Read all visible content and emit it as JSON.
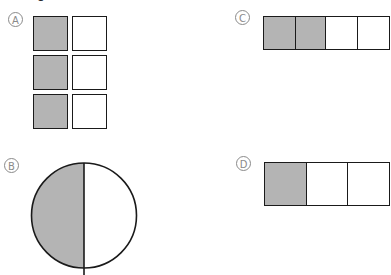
{
  "fragment_text": "1",
  "options": [
    {
      "id": "A",
      "label": "A",
      "shape": "grid",
      "rows": 3,
      "cols": 2,
      "total_parts": 6,
      "shaded_parts": 3,
      "fraction": "3/6",
      "shaded_cells": [
        [
          0,
          0
        ],
        [
          1,
          0
        ],
        [
          2,
          0
        ]
      ]
    },
    {
      "id": "B",
      "label": "B",
      "shape": "circle",
      "total_parts": 2,
      "shaded_parts": 1,
      "fraction": "1/2",
      "shaded_side": "left"
    },
    {
      "id": "C",
      "label": "C",
      "shape": "strip",
      "rows": 1,
      "cols": 4,
      "total_parts": 4,
      "shaded_parts": 2,
      "fraction": "2/4",
      "shaded_cells": [
        [
          0,
          0
        ],
        [
          0,
          1
        ]
      ]
    },
    {
      "id": "D",
      "label": "D",
      "shape": "strip",
      "rows": 1,
      "cols": 3,
      "total_parts": 3,
      "shaded_parts": 1,
      "fraction": "1/3",
      "shaded_cells": [
        [
          0,
          0
        ]
      ]
    }
  ],
  "colors": {
    "shade": "#b4b4b4",
    "outline": "#1a1a1a",
    "label": "#8a8a8a",
    "background": "#ffffff"
  }
}
